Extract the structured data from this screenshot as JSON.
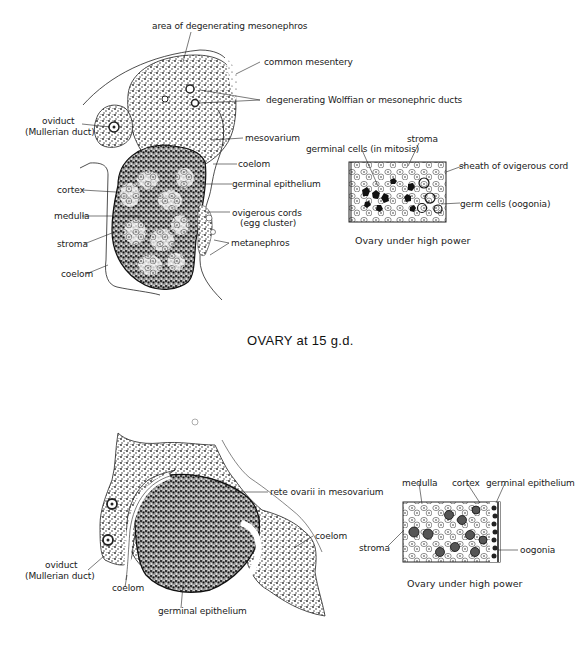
{
  "figure_top": {
    "title": "OVARY at 15 g.d.",
    "labels": {
      "area_mesonephros": "area of degenerating mesonephros",
      "common_mesentery": "common mesentery",
      "wolffian_ducts": "degenerating Wolffian or mesonephric ducts",
      "oviduct": "oviduct",
      "mullerian_duct": "(Mullerian duct)",
      "mesovarium": "mesovarium",
      "coelom_right": "coelom",
      "germinal_epithelium": "germinal epithelium",
      "cortex": "cortex",
      "medulla": "medulla",
      "ovigerous_cords": "ovigerous cords",
      "egg_cluster": "(egg cluster)",
      "stroma": "stroma",
      "metanephros": "metanephros",
      "coelom_left": "coelom"
    },
    "inset": {
      "caption": "Ovary under high power",
      "labels": {
        "germinal_cells": "germinal cells (in mitosis)",
        "stroma": "stroma",
        "sheath": "sheath of ovigerous cord",
        "germ_cells": "germ cells (oogonia)"
      }
    }
  },
  "figure_bottom": {
    "labels": {
      "rete_ovarii": "rete ovarii in mesovarium",
      "coelom_right": "coelom",
      "oviduct": "oviduct",
      "mullerian_duct": "(Mullerian duct)",
      "coelom_left": "coelom",
      "germinal_epithelium": "germinal epithelium"
    },
    "inset": {
      "caption": "Ovary under high power",
      "labels": {
        "medulla": "medulla",
        "cortex": "cortex",
        "germinal_epithelium": "germinal epithelium",
        "stroma": "stroma",
        "oogonia": "oogonia"
      }
    }
  }
}
